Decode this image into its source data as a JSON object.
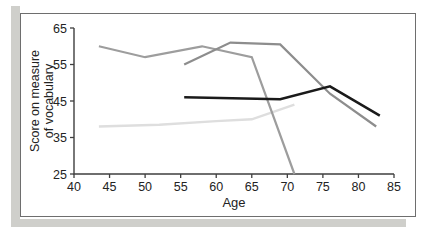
{
  "figure": {
    "background": "#ffffff",
    "frame_border_color": "#6e6e6e",
    "scan_shadow_color": "#cfcfcb",
    "axis_color": "#3f3f3f",
    "text_color": "#232323"
  },
  "chart_data": {
    "type": "line",
    "title": "",
    "xlabel": "Age",
    "ylabel": "Score on measure of vocabulary",
    "ylabel_lines": [
      "Score on measure",
      "of vocabulary"
    ],
    "xlim": [
      40,
      85
    ],
    "ylim": [
      25,
      65
    ],
    "x_ticks": [
      40,
      45,
      50,
      55,
      60,
      65,
      70,
      75,
      80,
      85
    ],
    "y_ticks": [
      25,
      35,
      45,
      55,
      65
    ],
    "grid": false,
    "legend": "none",
    "series": [
      {
        "name": "light-gray-line",
        "color": "#dedede",
        "width": 2.4,
        "points": [
          [
            43.5,
            38
          ],
          [
            52,
            38.5
          ],
          [
            60,
            39.5
          ],
          [
            65,
            40
          ],
          [
            71,
            44
          ]
        ]
      },
      {
        "name": "gray-line-starting-age-43",
        "color": "#9d9d9d",
        "width": 2.2,
        "points": [
          [
            43.5,
            60
          ],
          [
            50,
            57
          ],
          [
            58,
            60
          ],
          [
            65,
            57
          ],
          [
            71,
            25
          ]
        ]
      },
      {
        "name": "gray-line-starting-age-55",
        "color": "#8d8d8d",
        "width": 2.2,
        "points": [
          [
            55.5,
            55
          ],
          [
            62,
            61
          ],
          [
            69,
            60.5
          ],
          [
            76,
            47
          ],
          [
            82.5,
            38
          ]
        ]
      },
      {
        "name": "black-line",
        "color": "#1a1a1a",
        "width": 2.5,
        "points": [
          [
            55.5,
            46
          ],
          [
            69,
            45.5
          ],
          [
            76,
            49
          ],
          [
            83,
            41
          ]
        ]
      }
    ]
  }
}
